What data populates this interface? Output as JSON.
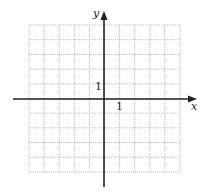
{
  "diagram": {
    "type": "coordinate-grid",
    "grid": {
      "left": 29,
      "top": 25,
      "cell_w": 15.1,
      "cell_h": 14.7,
      "cols": 10,
      "rows": 10,
      "line_color": "#b8b8b8",
      "style": "dotted"
    },
    "axes": {
      "origin_px": [
        104,
        99
      ],
      "color": "#222222",
      "x_label": "x",
      "y_label": "y",
      "x_tick_label": "1",
      "y_tick_label": "1",
      "x_range": [
        -5,
        5
      ],
      "y_range": [
        -5,
        5
      ]
    }
  }
}
